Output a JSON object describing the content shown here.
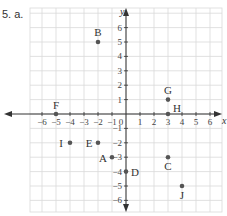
{
  "problem": {
    "label": "5. a."
  },
  "chart_data": {
    "type": "scatter",
    "title": "",
    "xlabel": "x",
    "ylabel": "y",
    "xlim": [
      -6,
      6
    ],
    "ylim": [
      -6,
      6
    ],
    "grid": true,
    "x_ticks": [
      -6,
      -5,
      -4,
      -3,
      -2,
      -1,
      1,
      2,
      3,
      4,
      5,
      6
    ],
    "y_ticks": [
      -6,
      -5,
      -4,
      -3,
      -2,
      -1,
      1,
      2,
      3,
      4,
      5,
      6
    ],
    "origin_label": "0",
    "points": [
      {
        "name": "A",
        "x": -1,
        "y": -3
      },
      {
        "name": "B",
        "x": -2,
        "y": 5
      },
      {
        "name": "C",
        "x": 3,
        "y": -3
      },
      {
        "name": "D",
        "x": 0,
        "y": -4
      },
      {
        "name": "E",
        "x": -2,
        "y": -2
      },
      {
        "name": "F",
        "x": -5,
        "y": 0
      },
      {
        "name": "G",
        "x": 3,
        "y": 1
      },
      {
        "name": "H",
        "x": 3,
        "y": 0
      },
      {
        "name": "I",
        "x": -4,
        "y": -2
      },
      {
        "name": "J",
        "x": 4,
        "y": -5
      }
    ]
  },
  "colors": {
    "grid": "#d9d9d9",
    "axis": "#333333",
    "point": "#555555"
  }
}
